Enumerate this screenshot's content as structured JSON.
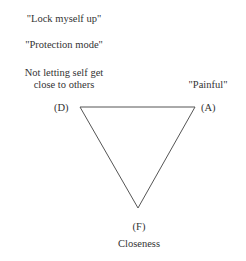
{
  "diagram": {
    "type": "triangle",
    "vertices": [
      {
        "id": "D",
        "label": "(D)",
        "x": 80,
        "y": 107
      },
      {
        "id": "A",
        "label": "(A)",
        "x": 195,
        "y": 107
      },
      {
        "id": "F",
        "label": "(F)",
        "x": 138,
        "y": 208
      }
    ],
    "edges": [
      [
        "D",
        "A"
      ],
      [
        "A",
        "F"
      ],
      [
        "F",
        "D"
      ]
    ],
    "line_color": "#555555"
  },
  "labels": {
    "lock_myself_up": "\"Lock myself up\"",
    "protection_mode": "\"Protection mode\"",
    "not_letting_line1": "Not letting self get",
    "not_letting_line2": "close to others",
    "painful": "\"Painful\"",
    "vertex_d": "(D)",
    "vertex_a": "(A)",
    "vertex_f": "(F)",
    "closeness": "Closeness"
  }
}
